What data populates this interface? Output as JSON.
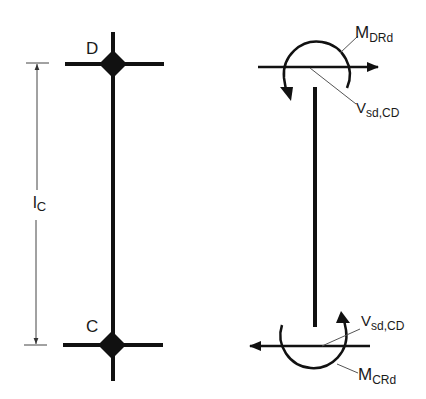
{
  "diagram": {
    "left": {
      "node_top": "D",
      "node_bottom": "C",
      "dimension_label": {
        "main": "l",
        "sub": "C"
      }
    },
    "right": {
      "top_moment": {
        "main": "M",
        "sub": "DRd"
      },
      "top_shear": {
        "main": "V",
        "sub": "sd,CD"
      },
      "bottom_shear": {
        "main": "V",
        "sub": "sd,CD"
      },
      "bottom_moment": {
        "main": "M",
        "sub": "CRd"
      }
    },
    "colors": {
      "stroke": "#111111",
      "leader": "#555555",
      "background": "#ffffff"
    }
  }
}
